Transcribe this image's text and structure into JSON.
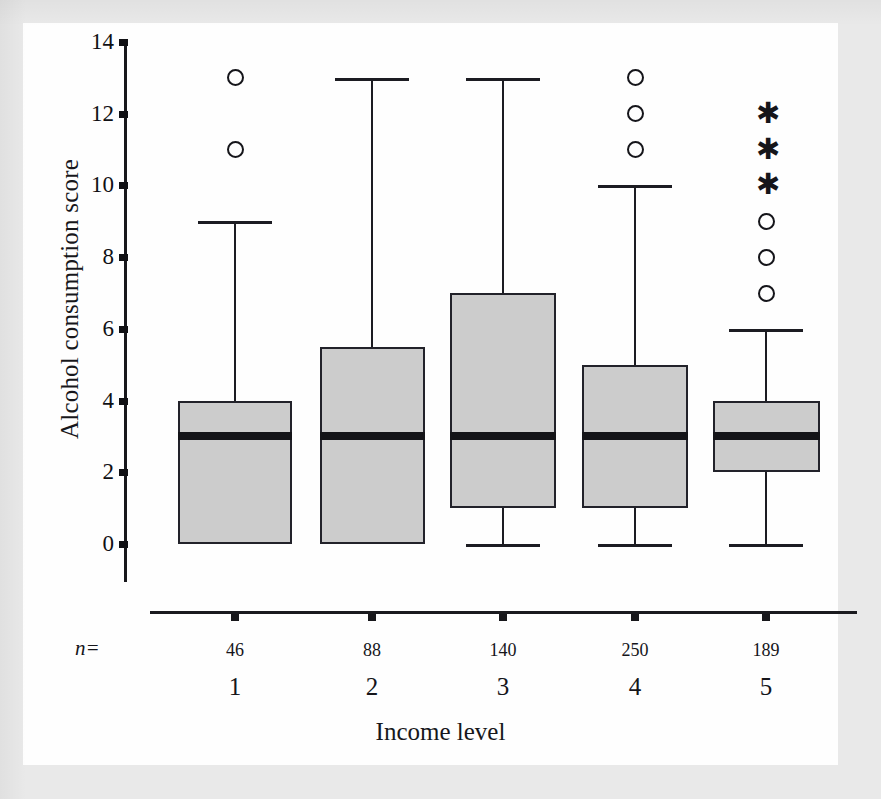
{
  "figure": {
    "ylabel": "Alcohol consumption score",
    "xlabel": "Income level",
    "n_prefix": "n=",
    "box_fill_color": "#cccccc",
    "line_color": "#15151a",
    "background_color": "#ffffff"
  },
  "chart_data": {
    "type": "box",
    "title": "",
    "xlabel": "Income level",
    "ylabel": "Alcohol consumption score",
    "ylim": [
      0,
      14
    ],
    "yticks": [
      0,
      2,
      4,
      6,
      8,
      10,
      12,
      14
    ],
    "grid": false,
    "legend": "none",
    "categories": [
      "1",
      "2",
      "3",
      "4",
      "5"
    ],
    "sample_sizes": [
      46,
      88,
      140,
      250,
      189
    ],
    "boxes": [
      {
        "category": "1",
        "n": 46,
        "whisker_low": 0,
        "q1": 0,
        "median": 3,
        "q3": 4,
        "whisker_high": 9,
        "outliers": [
          11,
          13
        ],
        "extremes": []
      },
      {
        "category": "2",
        "n": 88,
        "whisker_low": 0,
        "q1": 0,
        "median": 3,
        "q3": 5.5,
        "whisker_high": 13,
        "outliers": [],
        "extremes": []
      },
      {
        "category": "3",
        "n": 140,
        "whisker_low": 0,
        "q1": 1,
        "median": 3,
        "q3": 7,
        "whisker_high": 13,
        "outliers": [],
        "extremes": []
      },
      {
        "category": "4",
        "n": 250,
        "whisker_low": 0,
        "q1": 1,
        "median": 3,
        "q3": 5,
        "whisker_high": 10,
        "outliers": [
          11,
          12,
          13
        ],
        "extremes": []
      },
      {
        "category": "5",
        "n": 189,
        "whisker_low": 0,
        "q1": 2,
        "median": 3,
        "q3": 4,
        "whisker_high": 6,
        "outliers": [
          7,
          8,
          9
        ],
        "extremes": [
          10,
          11,
          12
        ]
      }
    ]
  }
}
